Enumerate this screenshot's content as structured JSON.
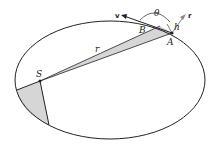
{
  "diagram": {
    "labels": {
      "S": "S",
      "A": "A",
      "B": "B",
      "r": "r",
      "h": "h",
      "theta": "θ",
      "v": "v",
      "r_vec": "r"
    },
    "colors": {
      "line": "#222222",
      "shade": "#d6d6d6",
      "arrow_r": "#888888"
    }
  }
}
